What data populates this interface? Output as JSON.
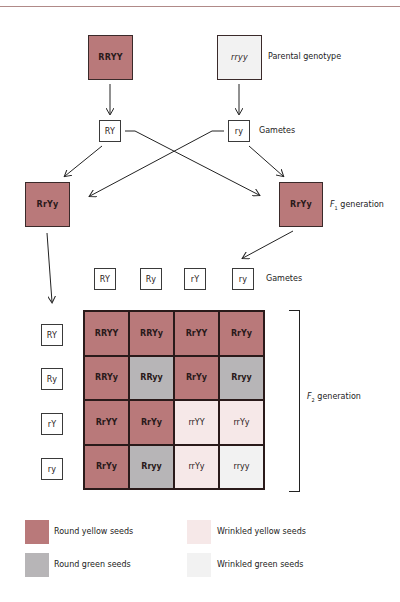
{
  "parental": {
    "left": {
      "genotype": "RRYY",
      "phenotype": "round-yellow"
    },
    "right": {
      "genotype": "rryy",
      "phenotype": "wrinkled-green"
    },
    "label": "Parental genotype"
  },
  "parental_gametes": {
    "left": "RY",
    "right": "ry",
    "label": "Gametes"
  },
  "f1": {
    "left": "RrYy",
    "right": "RrYy",
    "label_prefix": "F",
    "label_sub": "1",
    "label_suffix": " generation"
  },
  "f1_gametes": {
    "columns": [
      "RY",
      "Ry",
      "rY",
      "ry"
    ],
    "rows": [
      "RY",
      "Ry",
      "rY",
      "ry"
    ],
    "label": "Gametes"
  },
  "punnett": {
    "rows": [
      [
        {
          "g": "RRYY",
          "p": "ry"
        },
        {
          "g": "RRYy",
          "p": "ry"
        },
        {
          "g": "RrYY",
          "p": "ry"
        },
        {
          "g": "RrYy",
          "p": "ry"
        }
      ],
      [
        {
          "g": "RRYy",
          "p": "ry"
        },
        {
          "g": "RRyy",
          "p": "rg"
        },
        {
          "g": "RrYy",
          "p": "ry"
        },
        {
          "g": "Rryy",
          "p": "rg"
        }
      ],
      [
        {
          "g": "RrYY",
          "p": "ry"
        },
        {
          "g": "RrYy",
          "p": "ry"
        },
        {
          "g": "rrYY",
          "p": "wy"
        },
        {
          "g": "rrYy",
          "p": "wy"
        }
      ],
      [
        {
          "g": "RrYy",
          "p": "ry"
        },
        {
          "g": "Rryy",
          "p": "rg"
        },
        {
          "g": "rrYy",
          "p": "wy"
        },
        {
          "g": "rryy",
          "p": "wg"
        }
      ]
    ]
  },
  "f2": {
    "label_prefix": "F",
    "label_sub": "2",
    "label_suffix": " generation"
  },
  "legend": [
    {
      "key": "ry",
      "label": "Round yellow seeds"
    },
    {
      "key": "wy",
      "label": "Wrinkled yellow seeds"
    },
    {
      "key": "rg",
      "label": "Round green seeds"
    },
    {
      "key": "wg",
      "label": "Wrinkled green seeds"
    }
  ],
  "colors": {
    "round_yellow": "#b9797a",
    "round_green": "#b7b5b7",
    "wrinkled_yellow": "#f6e8e8",
    "wrinkled_green": "#f2f2f2",
    "line": "#2a2a2a"
  }
}
